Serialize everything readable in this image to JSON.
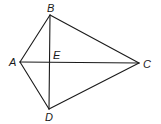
{
  "diagram": {
    "type": "geometry",
    "stroke_color": "#1a1a1a",
    "points": {
      "A": {
        "label": "A",
        "x": 20,
        "y": 62
      },
      "B": {
        "label": "B",
        "x": 50,
        "y": 15
      },
      "C": {
        "label": "C",
        "x": 139,
        "y": 63
      },
      "D": {
        "label": "D",
        "x": 49,
        "y": 109
      },
      "E": {
        "label": "E",
        "x": 50,
        "y": 62
      }
    },
    "segments": [
      [
        "A",
        "B"
      ],
      [
        "B",
        "C"
      ],
      [
        "C",
        "D"
      ],
      [
        "D",
        "A"
      ],
      [
        "A",
        "C"
      ],
      [
        "B",
        "D"
      ]
    ]
  }
}
